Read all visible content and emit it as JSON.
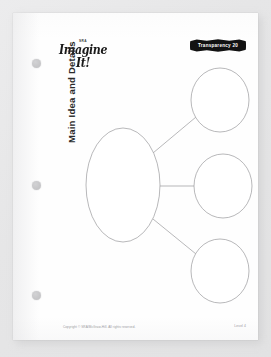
{
  "page": {
    "header": {
      "logo_superscript": "SRA",
      "logo_word": "Imagine It!",
      "transparency_label": "Transparency 20"
    },
    "title": "Main Idea and Details",
    "footer": {
      "copyright": "Copyright © SRA/McGraw-Hill. All rights reserved.",
      "level": "Level 4"
    },
    "holes": [
      {
        "name": "hole-punch-top"
      },
      {
        "name": "hole-punch-middle"
      },
      {
        "name": "hole-punch-bottom"
      }
    ]
  },
  "diagram": {
    "type": "graphic-organizer",
    "stroke_color": "#9a9a9c",
    "fill_color": "#ffffff",
    "main_node": {
      "label": "",
      "cx": 110,
      "cy": 172,
      "rx": 37,
      "ry": 57
    },
    "detail_nodes": [
      {
        "label": "",
        "cx": 207,
        "cy": 87,
        "rx": 29,
        "ry": 32
      },
      {
        "label": "",
        "cx": 210,
        "cy": 173,
        "rx": 29,
        "ry": 32
      },
      {
        "label": "",
        "cx": 207,
        "cy": 258,
        "rx": 29,
        "ry": 32
      }
    ],
    "connectors": [
      {
        "x1": 140,
        "y1": 140,
        "x2": 183,
        "y2": 104
      },
      {
        "x1": 147,
        "y1": 173,
        "x2": 181,
        "y2": 173
      },
      {
        "x1": 140,
        "y1": 206,
        "x2": 183,
        "y2": 241
      }
    ]
  }
}
